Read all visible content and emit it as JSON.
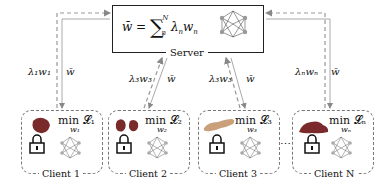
{
  "server": {
    "label": "Server",
    "formula": "w̄ = ∑ₙᴺ λₙwₙ",
    "icon": "neural-network-icon"
  },
  "clients": [
    {
      "label": "Client 1",
      "objective": "min 𝓛₁",
      "variable": "w₁",
      "upload": "λ₁w₁",
      "download": "w̄",
      "data_icon": "organ-icon",
      "privacy_icon": "lock-icon"
    },
    {
      "label": "Client 2",
      "objective": "min 𝓛₂",
      "variable": "w₂",
      "upload": "λ₂w₂",
      "download": "w̄",
      "data_icon": "kidneys-icon",
      "privacy_icon": "lock-icon"
    },
    {
      "label": "Client 3",
      "objective": "min 𝓛₃",
      "variable": "w₃",
      "upload": "λ₃w₃",
      "download": "w̄",
      "data_icon": "pancreas-icon",
      "privacy_icon": "lock-icon"
    },
    {
      "label": "Client N",
      "objective": "min 𝓛ₙ",
      "variable": "wₙ",
      "upload": "λₙwₙ",
      "download": "w̄",
      "data_icon": "liver-icon",
      "privacy_icon": "lock-icon"
    }
  ],
  "ellipsis": "⋯",
  "colors": {
    "arrow": "#9a9a9a",
    "organ": "#7a2a2a",
    "pancreas": "#c9a07a",
    "node": "#9a9a9a",
    "box_border": "#222222",
    "client_border": "#777777"
  }
}
